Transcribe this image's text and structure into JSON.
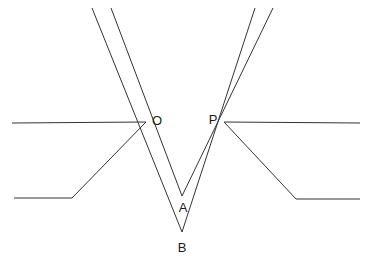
{
  "figure": {
    "kind": "geometry-ray-diagram",
    "background_color": "#ffffff",
    "stroke_color": "#333333",
    "stroke_width": 1,
    "width": 370,
    "height": 263,
    "labels": [
      {
        "text": "O",
        "x": 157,
        "y": 125
      },
      {
        "text": "P",
        "x": 213,
        "y": 124
      },
      {
        "text": "A",
        "x": 183,
        "y": 212
      },
      {
        "text": "B",
        "x": 182,
        "y": 252
      }
    ],
    "points": {
      "O": {
        "x": 146,
        "y": 122
      },
      "P": {
        "x": 224,
        "y": 122
      },
      "A": {
        "x": 182,
        "y": 196
      },
      "B": {
        "x": 182,
        "y": 232
      }
    },
    "paths": {
      "axis_left": "M 12 123 L 146 122",
      "axis_right": "M 224 122 L 360 123",
      "incident_ray_outer_left": "M 92 8 L 182 232",
      "incident_ray_inner_left": "M 111 8 L 182 196",
      "incident_ray_inner_right": "M 255 8 L 182 232",
      "incident_ray_outer_right": "M 273 8 L 182 196",
      "refracted_left_elbow": "M 146 122 L 72 198 L 14 198",
      "refracted_right_elbow": "M 224 122 L 296 199 L 360 199"
    },
    "path_names": [
      "axis_left",
      "axis_right",
      "incident_ray_outer_left",
      "incident_ray_inner_left",
      "incident_ray_inner_right",
      "incident_ray_outer_right",
      "refracted_left_elbow",
      "refracted_right_elbow"
    ]
  }
}
